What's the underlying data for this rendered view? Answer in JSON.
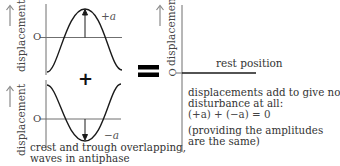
{
  "diagram": {
    "left_top_graph": {
      "axis_label": "displacement",
      "origin_label": "O",
      "amplitude_label": "+a",
      "arrow_icon": "up-arrow"
    },
    "operator_plus": "+",
    "left_bottom_graph": {
      "axis_label": "displacement",
      "origin_label": "O",
      "amplitude_label": "−a",
      "arrow_icon": "up-arrow"
    },
    "caption": {
      "line1": "crest and trough overlapping,",
      "line2": "waves in antiphase"
    },
    "operator_equals": "=",
    "result_graph": {
      "axis_label": "displacement",
      "origin_label": "O",
      "rest_label": "rest position",
      "arrow_icon": "up-arrow"
    },
    "result_note": {
      "line1": "displacements add to give no",
      "line2": "disturbance at all:",
      "equation": "(+a) + (−a) = 0",
      "line4": "(providing the amplitudes",
      "line5": "are the same)"
    },
    "colors": {
      "axis": "#6f6f6f",
      "curve": "#1a1a1a",
      "arrow_label": "#888888",
      "equals": "#000000"
    }
  }
}
